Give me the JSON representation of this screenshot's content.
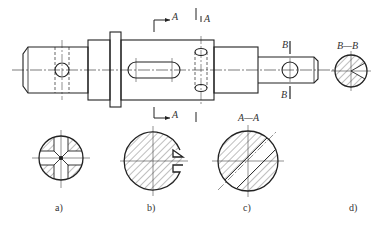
{
  "figure": {
    "section_marks": {
      "a_top": "A",
      "a_bottom": "A",
      "b_top": "B",
      "b_bottom": "B",
      "section_aa_title": "A—A",
      "section_bb_title": "B—B"
    },
    "captions": [
      "a)",
      "b)",
      "c)",
      "d)"
    ],
    "colors": {
      "line": "#222222",
      "hatch": "#444444",
      "background": "#ffffff"
    }
  }
}
